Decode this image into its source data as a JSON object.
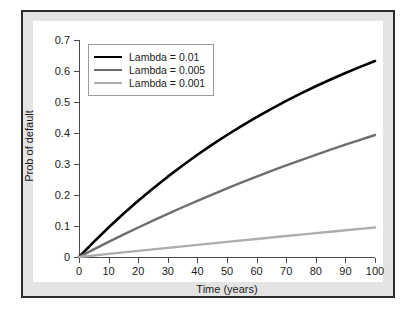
{
  "chart_data": {
    "type": "line",
    "title": "",
    "xlabel": "Time (years)",
    "ylabel": "Prob of default",
    "xlim": [
      0,
      100
    ],
    "ylim": [
      0,
      0.7
    ],
    "grid": false,
    "legend_position": "top-left",
    "x_ticks": [
      "0",
      "10",
      "20",
      "30",
      "40",
      "50",
      "60",
      "70",
      "80",
      "90",
      "100"
    ],
    "y_ticks": [
      "0",
      "0.1",
      "0.2",
      "0.3",
      "0.4",
      "0.5",
      "0.6",
      "0.7"
    ],
    "x": [
      0,
      5,
      10,
      15,
      20,
      25,
      30,
      35,
      40,
      45,
      50,
      55,
      60,
      65,
      70,
      75,
      80,
      85,
      90,
      95,
      100
    ],
    "series": [
      {
        "name": "Lambda = 0.01",
        "color": "#000000",
        "width": 2.6,
        "values": [
          0,
          0.0488,
          0.0952,
          0.1393,
          0.1813,
          0.2212,
          0.2592,
          0.2953,
          0.3297,
          0.3624,
          0.3935,
          0.4231,
          0.4512,
          0.478,
          0.5034,
          0.5276,
          0.5507,
          0.5726,
          0.5934,
          0.6133,
          0.6321
        ]
      },
      {
        "name": "Lambda = 0.005",
        "color": "#6e6e6e",
        "width": 2.4,
        "values": [
          0,
          0.0247,
          0.0488,
          0.0723,
          0.0952,
          0.1175,
          0.1393,
          0.1605,
          0.1813,
          0.2015,
          0.2212,
          0.2404,
          0.2592,
          0.2776,
          0.2953,
          0.3127,
          0.3297,
          0.3462,
          0.3624,
          0.3781,
          0.3935
        ]
      },
      {
        "name": "Lambda = 0.001",
        "color": "#adadad",
        "width": 2.4,
        "values": [
          0,
          0.005,
          0.01,
          0.0149,
          0.0198,
          0.0247,
          0.0296,
          0.0344,
          0.0392,
          0.044,
          0.0488,
          0.0535,
          0.0582,
          0.0629,
          0.0676,
          0.0723,
          0.0769,
          0.0815,
          0.0861,
          0.0906,
          0.0952
        ]
      }
    ]
  },
  "legend": {
    "items": [
      {
        "label": "Lambda = 0.01"
      },
      {
        "label": "Lambda = 0.005"
      },
      {
        "label": "Lambda = 0.001"
      }
    ]
  },
  "colors": {
    "series_1": "#000000",
    "series_2": "#6e6e6e",
    "series_3": "#adadad",
    "frame_border": "#2b2b2b",
    "frame_fill": "#e3e3e3",
    "plot_background": "#ffffff",
    "axis": "#4a4a4a",
    "text": "#1c1c1c"
  }
}
